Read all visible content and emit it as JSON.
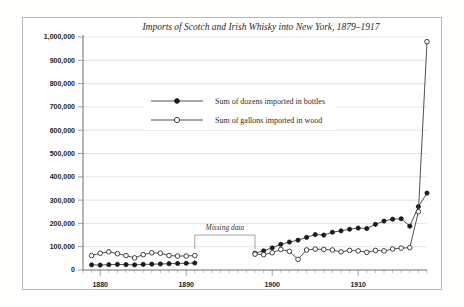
{
  "chart_data": {
    "type": "line",
    "title": "Imports of Scotch and Irish Whisky into New York, 1879–1917",
    "xlabel": "",
    "ylabel": "",
    "xlim": [
      1878,
      1918
    ],
    "ylim": [
      0,
      1000000
    ],
    "grid": true,
    "legend_position": "upper-center-left",
    "y_ticks": [
      0,
      100000,
      200000,
      300000,
      400000,
      500000,
      600000,
      700000,
      800000,
      900000,
      1000000
    ],
    "y_tick_labels": [
      "0",
      "100,000",
      "200,000",
      "300,000",
      "400,000",
      "500,000",
      "600,000",
      "700,000",
      "800,000",
      "900,000",
      "1,000,000"
    ],
    "x_ticks": [
      1880,
      1890,
      1900,
      1910
    ],
    "x_tick_labels": [
      "1880",
      "1890",
      "1900",
      "1910"
    ],
    "x_minor_tick_step": 1,
    "annotations": [
      {
        "text": "Missing data",
        "x_start": 1891,
        "x_end": 1898,
        "y": 150000,
        "style": "bracket"
      }
    ],
    "series": [
      {
        "name": "Sum of dozens imported in bottles",
        "marker": "filled-circle",
        "points": [
          {
            "x": 1879,
            "y": 22000
          },
          {
            "x": 1880,
            "y": 21000
          },
          {
            "x": 1881,
            "y": 23000
          },
          {
            "x": 1882,
            "y": 24000
          },
          {
            "x": 1883,
            "y": 23000
          },
          {
            "x": 1884,
            "y": 22000
          },
          {
            "x": 1885,
            "y": 24000
          },
          {
            "x": 1886,
            "y": 25000
          },
          {
            "x": 1887,
            "y": 26000
          },
          {
            "x": 1888,
            "y": 27000
          },
          {
            "x": 1889,
            "y": 28000
          },
          {
            "x": 1890,
            "y": 29000
          },
          {
            "x": 1891,
            "y": 30000
          },
          {
            "x": 1898,
            "y": 72000
          },
          {
            "x": 1899,
            "y": 82000
          },
          {
            "x": 1900,
            "y": 95000
          },
          {
            "x": 1901,
            "y": 110000
          },
          {
            "x": 1902,
            "y": 120000
          },
          {
            "x": 1903,
            "y": 128000
          },
          {
            "x": 1904,
            "y": 140000
          },
          {
            "x": 1905,
            "y": 152000
          },
          {
            "x": 1906,
            "y": 150000
          },
          {
            "x": 1907,
            "y": 162000
          },
          {
            "x": 1908,
            "y": 168000
          },
          {
            "x": 1909,
            "y": 175000
          },
          {
            "x": 1910,
            "y": 180000
          },
          {
            "x": 1911,
            "y": 178000
          },
          {
            "x": 1912,
            "y": 196000
          },
          {
            "x": 1913,
            "y": 210000
          },
          {
            "x": 1914,
            "y": 218000
          },
          {
            "x": 1915,
            "y": 220000
          },
          {
            "x": 1916,
            "y": 188000
          },
          {
            "x": 1917,
            "y": 272000
          },
          {
            "x": 1918,
            "y": 330000
          }
        ]
      },
      {
        "name": "Sum of gallons imported in wood",
        "marker": "open-circle",
        "points": [
          {
            "x": 1879,
            "y": 62000
          },
          {
            "x": 1880,
            "y": 72000
          },
          {
            "x": 1881,
            "y": 78000
          },
          {
            "x": 1882,
            "y": 70000
          },
          {
            "x": 1883,
            "y": 62000
          },
          {
            "x": 1884,
            "y": 52000
          },
          {
            "x": 1885,
            "y": 66000
          },
          {
            "x": 1886,
            "y": 74000
          },
          {
            "x": 1887,
            "y": 72000
          },
          {
            "x": 1888,
            "y": 62000
          },
          {
            "x": 1889,
            "y": 60000
          },
          {
            "x": 1890,
            "y": 60000
          },
          {
            "x": 1891,
            "y": 62000
          },
          {
            "x": 1898,
            "y": 68000
          },
          {
            "x": 1899,
            "y": 66000
          },
          {
            "x": 1900,
            "y": 74000
          },
          {
            "x": 1901,
            "y": 88000
          },
          {
            "x": 1902,
            "y": 80000
          },
          {
            "x": 1903,
            "y": 46000
          },
          {
            "x": 1904,
            "y": 86000
          },
          {
            "x": 1905,
            "y": 90000
          },
          {
            "x": 1906,
            "y": 88000
          },
          {
            "x": 1907,
            "y": 86000
          },
          {
            "x": 1908,
            "y": 78000
          },
          {
            "x": 1909,
            "y": 84000
          },
          {
            "x": 1910,
            "y": 82000
          },
          {
            "x": 1911,
            "y": 76000
          },
          {
            "x": 1912,
            "y": 84000
          },
          {
            "x": 1913,
            "y": 82000
          },
          {
            "x": 1914,
            "y": 90000
          },
          {
            "x": 1915,
            "y": 94000
          },
          {
            "x": 1916,
            "y": 96000
          },
          {
            "x": 1917,
            "y": 250000
          },
          {
            "x": 1918,
            "y": 980000
          }
        ]
      }
    ]
  }
}
